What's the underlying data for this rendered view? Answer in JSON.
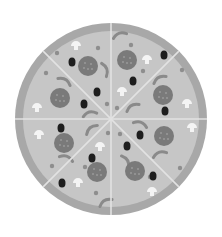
{
  "image": {
    "subject": "pizza-illustration",
    "slices": 8,
    "colors": {
      "background": "#ffffff",
      "crust": "#a8a8a8",
      "cheese": "#c6c6c6",
      "cut_line": "#e2e2e2",
      "pepperoni": "#7a7a7a",
      "olive": "#1e1e1e",
      "mushroom": "#f4f4f4",
      "pepper": "#8a8a8a",
      "herb": "#8e8e8e"
    },
    "pepperoni": [
      [
        88,
        66
      ],
      [
        127,
        60
      ],
      [
        60,
        98
      ],
      [
        163,
        95
      ],
      [
        64,
        143
      ],
      [
        164,
        136
      ],
      [
        97,
        172
      ],
      [
        135,
        171
      ]
    ],
    "olives": [
      [
        72,
        62
      ],
      [
        164,
        55
      ],
      [
        97,
        92
      ],
      [
        133,
        81
      ],
      [
        84,
        104
      ],
      [
        165,
        111
      ],
      [
        61,
        128
      ],
      [
        127,
        146
      ],
      [
        140,
        135
      ],
      [
        92,
        158
      ],
      [
        153,
        176
      ],
      [
        62,
        183
      ]
    ],
    "mushrooms": [
      [
        76,
        46
      ],
      [
        147,
        60
      ],
      [
        122,
        92
      ],
      [
        37,
        108
      ],
      [
        187,
        104
      ],
      [
        39,
        135
      ],
      [
        192,
        128
      ],
      [
        100,
        147
      ],
      [
        78,
        183
      ],
      [
        152,
        192
      ]
    ],
    "peppers": [
      [
        120,
        36,
        -20
      ],
      [
        104,
        70,
        70
      ],
      [
        64,
        82,
        30
      ],
      [
        160,
        80,
        -30
      ],
      [
        90,
        115,
        -15
      ],
      [
        133,
        108,
        -30
      ],
      [
        92,
        130,
        -40
      ],
      [
        140,
        125,
        20
      ],
      [
        160,
        155,
        -20
      ],
      [
        66,
        159,
        20
      ],
      [
        125,
        162,
        60
      ],
      [
        106,
        203,
        -30
      ]
    ],
    "herbs": [
      [
        57,
        53
      ],
      [
        131,
        45
      ],
      [
        98,
        48
      ],
      [
        46,
        73
      ],
      [
        182,
        70
      ],
      [
        143,
        71
      ],
      [
        107,
        104
      ],
      [
        117,
        108
      ],
      [
        108,
        133
      ],
      [
        120,
        134
      ],
      [
        52,
        166
      ],
      [
        85,
        167
      ],
      [
        180,
        168
      ],
      [
        96,
        193
      ],
      [
        150,
        177
      ]
    ]
  }
}
